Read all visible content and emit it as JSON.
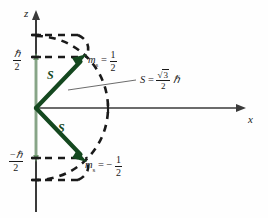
{
  "figure": {
    "background_color": "#fefefe",
    "axes": {
      "z_label": "z",
      "x_label": "x",
      "axis_color": "#3a3a3a"
    },
    "vectors": {
      "label": "S",
      "color": "#14481f",
      "up": {
        "label": "S",
        "tail": [
          36,
          108
        ],
        "tip": [
          85,
          57
        ]
      },
      "down": {
        "label": "S",
        "tail": [
          36,
          108
        ],
        "tip": [
          85,
          158
        ]
      }
    },
    "z_ticks": [
      {
        "id": "plus-h-over-2",
        "numerator": "ℏ",
        "denominator": "2",
        "sign": "",
        "y": 57
      },
      {
        "id": "minus-h-over-2",
        "numerator": "ℏ",
        "denominator": "2",
        "sign": "−",
        "y": 158
      }
    ],
    "projection_segment": {
      "color": "#7fa77f",
      "from_y": 57,
      "to_y": 158
    },
    "state_labels": [
      {
        "id": "ms-up",
        "symbol": "m",
        "subscript": "s",
        "equals": "=",
        "sign": "",
        "numerator": "1",
        "denominator": "2",
        "text": "ms = 1/2"
      },
      {
        "id": "ms-down",
        "symbol": "m",
        "subscript": "s",
        "equals": "=",
        "sign": "−",
        "numerator": "1",
        "denominator": "2",
        "text": "ms = -1/2"
      }
    ],
    "magnitude_annotation": {
      "symbol": "S",
      "equals": "=",
      "radical": "√",
      "radicand": "3",
      "denominator": "2",
      "unit": "ℏ",
      "text": "S = (sqrt(3)/2) hbar"
    },
    "dashed_color": "#1a1a1a",
    "cone_arcs": {
      "top_outer_y": 35,
      "top_inner_y": 57,
      "bottom_inner_y": 158,
      "bottom_outer_y": 180,
      "radius": 72
    }
  }
}
